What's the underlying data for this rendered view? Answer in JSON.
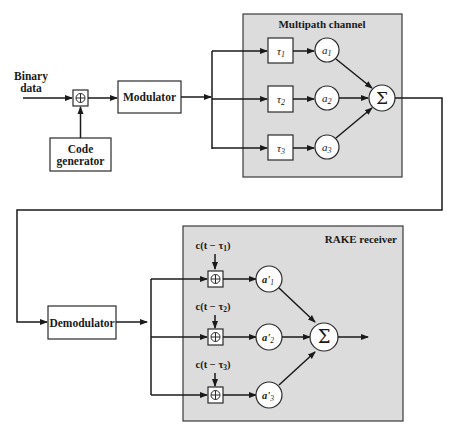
{
  "diagram": {
    "transmitter": {
      "input_label_line1": "Binary",
      "input_label_line2": "data",
      "xor_symbol": "⊕",
      "modulator_label": "Modulator",
      "code_generator_line1": "Code",
      "code_generator_line2": "generator"
    },
    "channel": {
      "title": "Multipath channel",
      "paths": [
        {
          "delay_symbol": "τ",
          "delay_sub": "1",
          "gain_symbol": "a",
          "gain_sub": "1"
        },
        {
          "delay_symbol": "τ",
          "delay_sub": "2",
          "gain_symbol": "a",
          "gain_sub": "2"
        },
        {
          "delay_symbol": "τ",
          "delay_sub": "3",
          "gain_symbol": "a",
          "gain_sub": "3"
        }
      ],
      "sum_symbol": "Σ"
    },
    "receiver": {
      "demodulator_label": "Demodulator",
      "title": "RAKE receiver",
      "fingers": [
        {
          "code_label": "c(t − τ",
          "code_sub": "1",
          "code_close": ")",
          "xor_symbol": "⊕",
          "gain_symbol": "a'",
          "gain_sub": "1"
        },
        {
          "code_label": "c(t − τ",
          "code_sub": "2",
          "code_close": ")",
          "xor_symbol": "⊕",
          "gain_symbol": "a'",
          "gain_sub": "2"
        },
        {
          "code_label": "c(t − τ",
          "code_sub": "3",
          "code_close": ")",
          "xor_symbol": "⊕",
          "gain_symbol": "a'",
          "gain_sub": "3"
        }
      ],
      "sum_symbol": "Σ"
    },
    "colors": {
      "panel_fill": "#dcdcdc",
      "line": "#1a1a1a",
      "box_fill": "#ffffff"
    }
  }
}
